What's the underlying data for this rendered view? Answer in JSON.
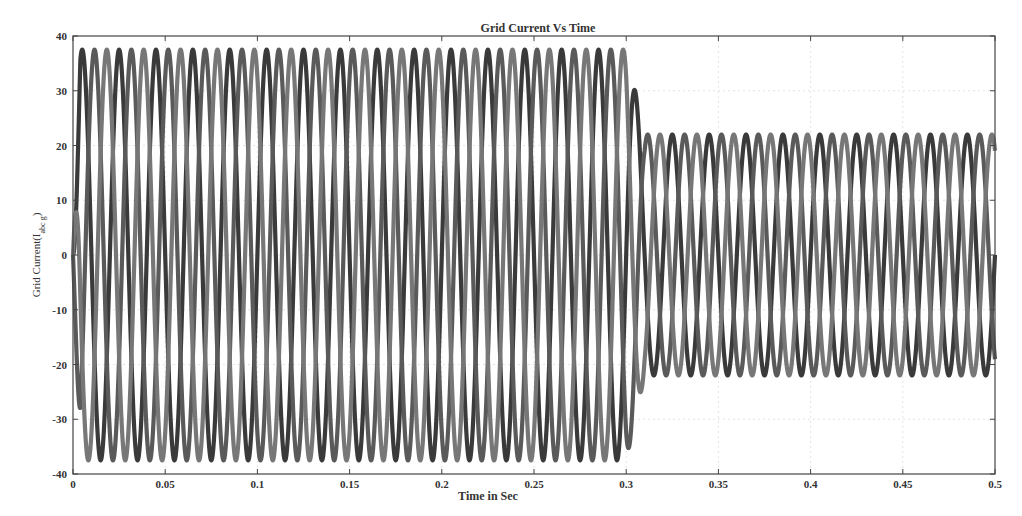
{
  "chart_data": {
    "type": "line",
    "title": "Grid Current Vs Time",
    "xlabel": "Time in Sec",
    "ylabel": "Grid Current(I_abc_g)",
    "ylabel_main": "Grid Current(I",
    "ylabel_sub": "abc g",
    "ylabel_close": ")",
    "xlim": [
      0,
      0.5
    ],
    "ylim": [
      -40,
      40
    ],
    "xticks": [
      0,
      0.05,
      0.1,
      0.15,
      0.2,
      0.25,
      0.3,
      0.35,
      0.4,
      0.45,
      0.5
    ],
    "xtick_labels": [
      "0",
      "0.05",
      "0.1",
      "0.15",
      "0.2",
      "0.25",
      "0.3",
      "0.35",
      "0.4",
      "0.45",
      "0.5"
    ],
    "yticks": [
      40,
      30,
      20,
      10,
      0,
      -10,
      -20,
      -30,
      -40
    ],
    "ytick_labels": [
      "40",
      "30",
      "20",
      "10",
      "0",
      "-10",
      "-20",
      "-30",
      "-40"
    ],
    "grid": true,
    "legend": null,
    "frequency_hz": 50,
    "series": [
      {
        "name": "Phase a",
        "color": "#3a3a3a",
        "phase_deg": 0,
        "segments": [
          {
            "t_start": 0.0,
            "t_end": 0.3,
            "amplitude": 37.5
          },
          {
            "t_start": 0.31,
            "t_end": 0.5,
            "amplitude": 22
          }
        ]
      },
      {
        "name": "Phase b",
        "color": "#5a5a5a",
        "phase_deg": -120,
        "segments": [
          {
            "t_start": 0.0,
            "t_end": 0.3,
            "amplitude": 37.5
          },
          {
            "t_start": 0.31,
            "t_end": 0.5,
            "amplitude": 22
          }
        ]
      },
      {
        "name": "Phase c",
        "color": "#777777",
        "phase_deg": 120,
        "segments": [
          {
            "t_start": 0.0,
            "t_end": 0.3,
            "amplitude": 37.5
          },
          {
            "t_start": 0.31,
            "t_end": 0.5,
            "amplitude": 22
          }
        ]
      }
    ],
    "annotations": [
      "Amplitude drops from ~37.5 A to ~22 A at t ≈ 0.3 s"
    ]
  }
}
